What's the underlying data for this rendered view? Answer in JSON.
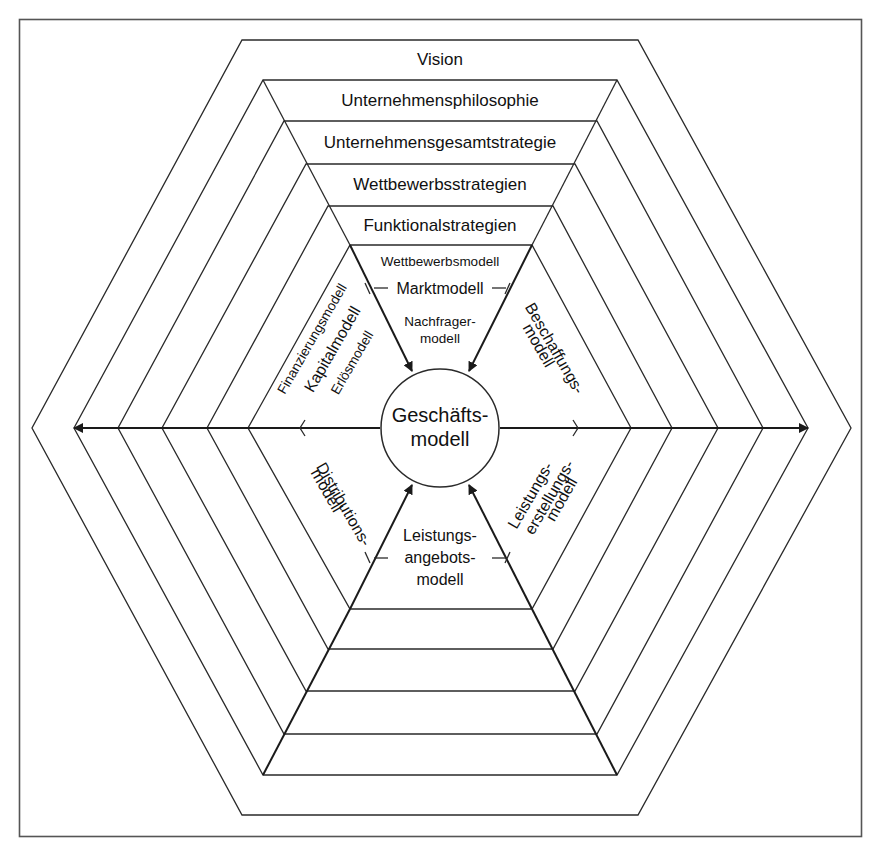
{
  "diagram": {
    "center": {
      "line1": "Geschäfts-",
      "line2": "modell"
    },
    "top_layers": [
      {
        "label": "Vision"
      },
      {
        "label": "Unternehmensphilosophie"
      },
      {
        "label": "Unternehmensgesamtstrategie"
      },
      {
        "label": "Wettbewerbsstrategien"
      },
      {
        "label": "Funktionalstrategien"
      }
    ],
    "sectors": {
      "top": {
        "sub_above": "Wettbewerbsmodell",
        "main": "Marktmodell",
        "sub_below_1": "Nachfrager-",
        "sub_below_2": "modell"
      },
      "upper_left": {
        "sub_outer": "Finanzierungsmodell",
        "main": "Kapitalmodell",
        "sub_inner": "Erlösmodell"
      },
      "upper_right": {
        "line1": "Beschaffungs-",
        "line2": "modell"
      },
      "lower_left": {
        "line1": "Distributions-",
        "line2": "modell"
      },
      "lower_right": {
        "line1": "Leistungs-",
        "line2": "erstellungs-",
        "line3": "modell"
      },
      "bottom": {
        "line1": "Leistungs-",
        "line2": "angebots-",
        "line3": "modell"
      }
    },
    "colors": {
      "line": "#2a2a2a",
      "text": "#111111",
      "background": "#ffffff",
      "frame": "#555555"
    }
  }
}
